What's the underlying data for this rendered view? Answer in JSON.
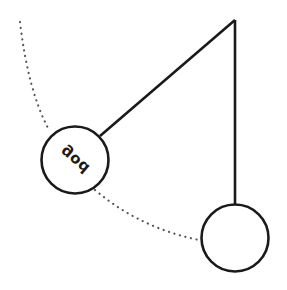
{
  "diagram": {
    "type": "pendulum",
    "pivot": {
      "x": 235,
      "y": 20
    },
    "swung_bob": {
      "cx": 75,
      "cy": 160,
      "r": 34,
      "label": "god"
    },
    "rest_bob": {
      "cx": 235,
      "cy": 238,
      "r": 34
    },
    "swing_arc": "dotted",
    "colors": {
      "stroke": "#1a1a1a",
      "dots": "#555555",
      "background": "#ffffff"
    }
  }
}
